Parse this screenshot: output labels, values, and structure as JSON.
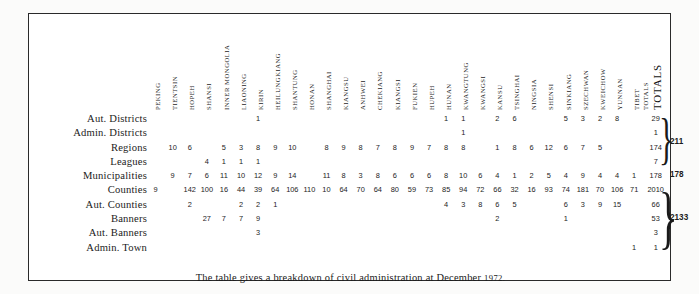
{
  "table": {
    "columns": [
      "PEKING",
      "TIENTSIN",
      "HOPEH",
      "SHANSI",
      "INNER MONGOLIA",
      "LIAONING",
      "KIRIN",
      "HEILUNGKIANG",
      "SHANTUNG",
      "HONAN",
      "SHANGHAI",
      "KIANGSU",
      "ANHWEI",
      "CHEKIANG",
      "KIANGSI",
      "FUKIEN",
      "HUPEH",
      "HUNAN",
      "KWANGTUNG",
      "KWANGSI",
      "KANSU",
      "TSINGHAI",
      "NINGSIA",
      "SHENSI",
      "SINKIANG",
      "SZECHWAN",
      "KWEICHOW",
      "YUNNAN",
      "TIBET"
    ],
    "totals_column_header": "TOTALS",
    "grand_totals_header": "TOTALS",
    "rows": [
      {
        "label": "Aut. Districts",
        "values": [
          "",
          "",
          "",
          "",
          "",
          "",
          "1",
          "",
          "",
          "",
          "",
          "",
          "",
          "",
          "",
          "",
          "",
          "1",
          "1",
          "",
          "2",
          "6",
          "",
          "",
          "5",
          "3",
          "2",
          "8",
          ""
        ],
        "total": "29"
      },
      {
        "label": "Admin. Districts",
        "values": [
          "",
          "",
          "",
          "",
          "",
          "",
          "",
          "",
          "",
          "",
          "",
          "",
          "",
          "",
          "",
          "",
          "",
          "",
          "1",
          "",
          "",
          "",
          "",
          "",
          "",
          "",
          "",
          "",
          ""
        ],
        "total": "1"
      },
      {
        "label": "Regions",
        "values": [
          "",
          "10",
          "6",
          "",
          "5",
          "3",
          "8",
          "9",
          "10",
          "",
          "8",
          "9",
          "8",
          "7",
          "8",
          "9",
          "7",
          "8",
          "8",
          "",
          "1",
          "8",
          "6",
          "12",
          "6",
          "7",
          "5",
          "",
          ""
        ],
        "total": "174"
      },
      {
        "label": "Leagues",
        "values": [
          "",
          "",
          "",
          "4",
          "1",
          "1",
          "1",
          "",
          "",
          "",
          "",
          "",
          "",
          "",
          "",
          "",
          "",
          "",
          "",
          "",
          "",
          "",
          "",
          "",
          "",
          "",
          "",
          "",
          ""
        ],
        "total": "7"
      },
      {
        "label": "Municipalities",
        "values": [
          "",
          "9",
          "7",
          "6",
          "11",
          "10",
          "12",
          "9",
          "14",
          "",
          "11",
          "8",
          "3",
          "8",
          "6",
          "6",
          "6",
          "8",
          "10",
          "6",
          "4",
          "1",
          "2",
          "5",
          "4",
          "9",
          "4",
          "4",
          "1"
        ],
        "total": "178"
      },
      {
        "label": "Counties",
        "values": [
          "9",
          "",
          "142",
          "100",
          "16",
          "44",
          "39",
          "64",
          "106",
          "110",
          "10",
          "64",
          "70",
          "64",
          "80",
          "59",
          "73",
          "85",
          "94",
          "72",
          "66",
          "32",
          "16",
          "93",
          "74",
          "181",
          "70",
          "106",
          "71"
        ],
        "total": "2010"
      },
      {
        "label": "Aut. Counties",
        "values": [
          "",
          "",
          "2",
          "",
          "",
          "2",
          "2",
          "1",
          "",
          "",
          "",
          "",
          "",
          "",
          "",
          "",
          "",
          "4",
          "3",
          "8",
          "6",
          "5",
          "",
          "",
          "6",
          "3",
          "9",
          "15",
          ""
        ],
        "total": "66"
      },
      {
        "label": "Banners",
        "values": [
          "",
          "",
          "",
          "27",
          "7",
          "7",
          "9",
          "",
          "",
          "",
          "",
          "",
          "",
          "",
          "",
          "",
          "",
          "",
          "",
          "",
          "2",
          "",
          "",
          "",
          "1",
          "",
          "",
          "",
          ""
        ],
        "total": "53"
      },
      {
        "label": "Aut. Banners",
        "values": [
          "",
          "",
          "",
          "",
          "",
          "",
          "3",
          "",
          "",
          "",
          "",
          "",
          "",
          "",
          "",
          "",
          "",
          "",
          "",
          "",
          "",
          "",
          "",
          "",
          "",
          "",
          "",
          "",
          ""
        ],
        "total": "3"
      },
      {
        "label": "Admin. Town",
        "values": [
          "",
          "",
          "",
          "",
          "",
          "",
          "",
          "",
          "",
          "",
          "",
          "",
          "",
          "",
          "",
          "",
          "",
          "",
          "",
          "",
          "",
          "",
          "",
          "",
          "",
          "",
          "",
          "",
          "1"
        ],
        "total": "1"
      }
    ],
    "group_totals": [
      {
        "value": "211",
        "covers": "Aut. Districts through Leagues"
      },
      {
        "value": "178",
        "covers": "Municipalities"
      },
      {
        "value": "2133",
        "covers": "Counties through Admin. Town"
      }
    ]
  },
  "caption": {
    "text": "The table gives a breakdown of civil administration at December ",
    "year": "1972."
  }
}
